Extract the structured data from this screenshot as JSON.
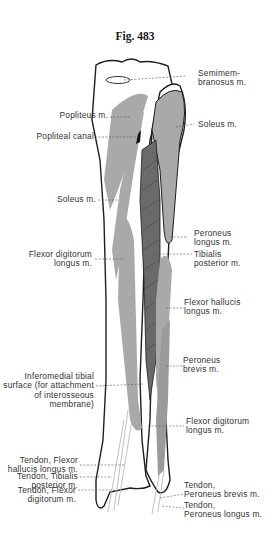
{
  "figure": {
    "title": "Fig. 483",
    "colors": {
      "muscle": "#a9a9a9",
      "outline": "#1e1e1e",
      "leader": "#555555",
      "background": "#ffffff"
    }
  },
  "labels": {
    "left": [
      {
        "id": "popliteus",
        "text": "Popliteus m."
      },
      {
        "id": "popliteal_canal",
        "text": "Popliteal canal"
      },
      {
        "id": "soleus_left",
        "text": "Soleus m."
      },
      {
        "id": "flexor_digitorum_left",
        "text": "Flexor digitorum\nlongus m."
      },
      {
        "id": "inferomedial",
        "text": "Inferomedial tibial\nsurface (for attachment\nof interosseous\nmembrane)"
      },
      {
        "id": "tendon_fhl",
        "text": "Tendon, Flexor\nhallucis longus m."
      },
      {
        "id": "tendon_tp",
        "text": "Tendon, Tibialis\nposterior m."
      },
      {
        "id": "tendon_fd",
        "text": "Tendon, Flexor\ndigitorum m."
      }
    ],
    "right": [
      {
        "id": "semimembranosus",
        "text": "Semimem-\nbranosus m."
      },
      {
        "id": "soleus_right",
        "text": "Soleus m."
      },
      {
        "id": "peroneus_longus",
        "text": "Peroneus\nlongus m."
      },
      {
        "id": "tibialis_posterior",
        "text": "Tibialis\nposterior m."
      },
      {
        "id": "flexor_hallucis",
        "text": "Flexor hallucis\nlongus m."
      },
      {
        "id": "peroneus_brevis",
        "text": "Peroneus\nbrevis m."
      },
      {
        "id": "flexor_digitorum_right",
        "text": "Flexor digitorum\nlongus m."
      },
      {
        "id": "tendon_pb",
        "text": "Tendon,\nPeroneus brevis m."
      },
      {
        "id": "tendon_pl",
        "text": "Tendon,\nPeroneus longus m."
      }
    ]
  }
}
